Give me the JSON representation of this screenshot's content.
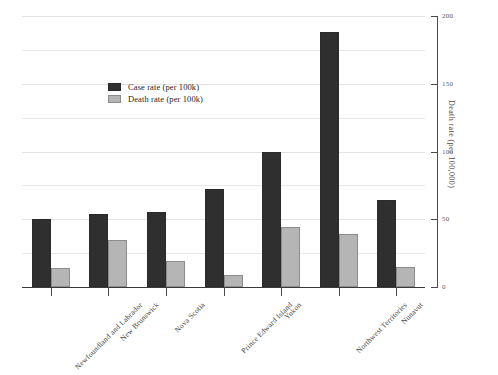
{
  "chart_data": {
    "type": "bar",
    "title": "",
    "xlabel": "",
    "ylabel": "Death rate (per 100,000)",
    "ylim": [
      0,
      200
    ],
    "yticks": [
      0,
      50,
      100,
      150,
      200
    ],
    "grid": true,
    "grid_interval": 25,
    "legend_position": "upper-left-inside",
    "categories": [
      "Newfoundland and Labrador",
      "New Brunswick",
      "Nova Scotia",
      "Prince Edward Island",
      "Yukon",
      "Northwest Territories",
      "Nunavut"
    ],
    "series": [
      {
        "name": "Case rate (per 100k)",
        "color": "#2f2f2f",
        "values": [
          50,
          54,
          55,
          72,
          100,
          188,
          64
        ]
      },
      {
        "name": "Death rate (per 100k)",
        "color": "#b5b5b5",
        "values": [
          14,
          35,
          19,
          9,
          44,
          39,
          15
        ]
      }
    ]
  },
  "axis": {
    "right_title": "Death rate (per 100,000)",
    "tick_labels": [
      "0",
      "50",
      "100",
      "150",
      "200"
    ]
  },
  "legend": {
    "items": [
      {
        "label": "Case rate (per 100k)",
        "swatch": "case"
      },
      {
        "label": "Death rate (per 100k)",
        "swatch": "death"
      }
    ]
  }
}
